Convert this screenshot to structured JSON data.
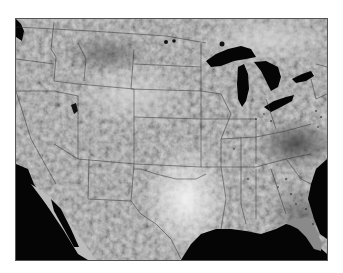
{
  "map": {
    "type": "grayscale satellite image",
    "region": "contiguous United States",
    "colors": {
      "water": "#050505",
      "land_base": "#9a9a9a",
      "bright_area": "#eeeeee",
      "dark_area": "#4a4a4a",
      "border_lines": "#333333",
      "frame": "#555555",
      "background": "#ffffff"
    }
  }
}
